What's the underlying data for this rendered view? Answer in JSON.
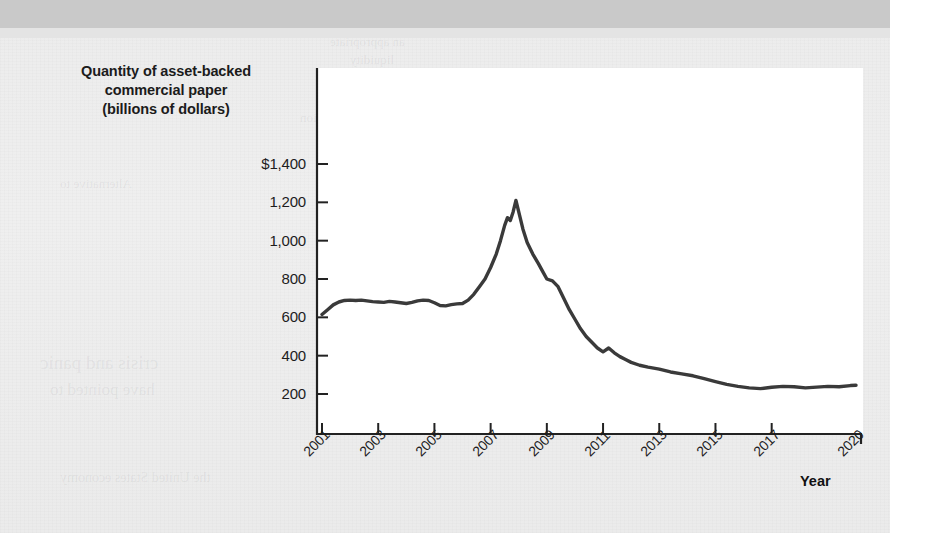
{
  "chart_data": {
    "type": "line",
    "title": "",
    "ylabel": "Quantity of asset-backed commercial paper (billions of dollars)",
    "xlabel": "Year",
    "ytick_labels": [
      "$1,400",
      "1,200",
      "1,000",
      "800",
      "600",
      "400",
      "200"
    ],
    "ytick_values": [
      1400,
      1200,
      1000,
      800,
      600,
      400,
      200
    ],
    "xtick_labels": [
      "2001",
      "2003",
      "2005",
      "2007",
      "2009",
      "2011",
      "2013",
      "2015",
      "2017",
      "2020"
    ],
    "xtick_values": [
      2001,
      2003,
      2005,
      2007,
      2009,
      2011,
      2013,
      2015,
      2017,
      2020
    ],
    "xlim": [
      2001,
      2020
    ],
    "ylim": [
      100,
      1480
    ],
    "grid": false,
    "legend": false,
    "series": [
      {
        "name": "Asset-backed commercial paper outstanding",
        "color": "#3a3a3a",
        "x": [
          2001.0,
          2001.2,
          2001.4,
          2001.6,
          2001.8,
          2002.0,
          2002.2,
          2002.4,
          2002.6,
          2002.8,
          2003.0,
          2003.2,
          2003.4,
          2003.6,
          2003.8,
          2004.0,
          2004.2,
          2004.4,
          2004.6,
          2004.8,
          2005.0,
          2005.2,
          2005.4,
          2005.6,
          2005.8,
          2006.0,
          2006.2,
          2006.4,
          2006.6,
          2006.8,
          2007.0,
          2007.2,
          2007.35,
          2007.5,
          2007.6,
          2007.7,
          2007.8,
          2007.9,
          2008.0,
          2008.15,
          2008.3,
          2008.5,
          2008.7,
          2008.85,
          2009.0,
          2009.2,
          2009.4,
          2009.6,
          2009.8,
          2010.0,
          2010.2,
          2010.4,
          2010.6,
          2010.8,
          2011.0,
          2011.2,
          2011.4,
          2011.6,
          2011.8,
          2012.0,
          2012.3,
          2012.6,
          2013.0,
          2013.4,
          2013.8,
          2014.2,
          2014.6,
          2015.0,
          2015.4,
          2015.8,
          2016.2,
          2016.6,
          2017.0,
          2017.4,
          2017.8,
          2018.2,
          2018.6,
          2019.0,
          2019.4,
          2019.8,
          2020.0
        ],
        "y": [
          615,
          640,
          665,
          680,
          688,
          690,
          688,
          690,
          686,
          682,
          680,
          678,
          683,
          680,
          676,
          672,
          678,
          686,
          690,
          688,
          676,
          662,
          660,
          666,
          670,
          672,
          690,
          720,
          760,
          800,
          860,
          930,
          1000,
          1080,
          1120,
          1105,
          1150,
          1210,
          1150,
          1060,
          990,
          930,
          880,
          840,
          800,
          790,
          760,
          700,
          640,
          590,
          540,
          500,
          470,
          440,
          420,
          440,
          415,
          395,
          380,
          365,
          350,
          340,
          330,
          315,
          305,
          295,
          280,
          265,
          250,
          240,
          232,
          228,
          235,
          240,
          238,
          232,
          236,
          240,
          238,
          244,
          246
        ]
      }
    ]
  },
  "ghost_text": {
    "line1": "an appropriate",
    "line2": "liquidity",
    "line3": "to the",
    "line4": "financial system",
    "line5": "that again in Section",
    "line6": "Alternative to",
    "line7": "crisis and panic",
    "line8": "have pointed to",
    "line9": "the United States economy"
  }
}
